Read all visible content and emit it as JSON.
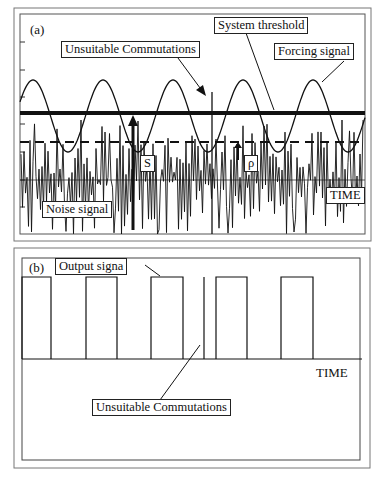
{
  "panel_a": {
    "tag": "(a)",
    "labels": {
      "unsuitable": "Unsuitable Commutations",
      "threshold": "System threshold",
      "forcing": "Forcing signal",
      "noise": "Noise signal",
      "time": "TIME",
      "s": "S",
      "rho": "ρ"
    }
  },
  "panel_b": {
    "tag": "(b)",
    "labels": {
      "output": "Output signa",
      "time": "TIME",
      "unsuitable": "Unsuitable Commutations"
    }
  },
  "diagram_data": {
    "forcing_signal": {
      "type": "sine",
      "period_px": 70,
      "first_peak_x": 33,
      "peak_y": 80,
      "trough_y": 152
    },
    "system_threshold_y": 113,
    "dashed_level_y": 142,
    "noise_mean_y": 180,
    "output_pulses_x": [
      [
        22,
        51
      ],
      [
        86,
        117
      ],
      [
        151,
        183
      ],
      [
        216,
        247
      ],
      [
        281,
        313
      ]
    ],
    "unsuitable_spike_x": 204,
    "output_high_y": 277,
    "output_low_y": 359,
    "colors": {
      "line": "#111111",
      "frame": "#555555",
      "background": "#ffffff"
    }
  }
}
